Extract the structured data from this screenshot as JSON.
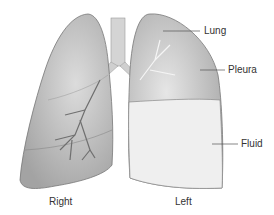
{
  "diagram": {
    "labels": {
      "lung": "Lung",
      "pleura": "Pleura",
      "fluid": "Fluid",
      "right": "Right",
      "left": "Left"
    },
    "colors": {
      "lung_fill": "#b5b5b5",
      "lung_dark": "#8f8f8f",
      "fluid_fill": "#efefef",
      "outline": "#777777",
      "airway": "#cfcfcf"
    }
  }
}
